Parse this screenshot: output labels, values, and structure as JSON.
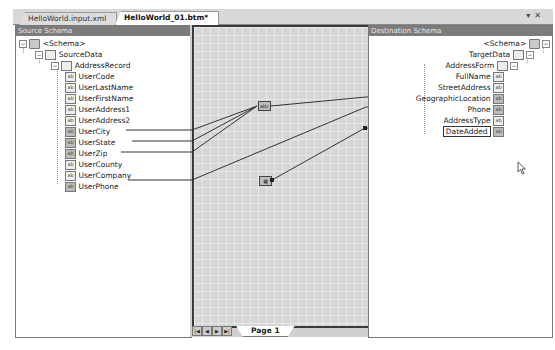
{
  "tabs": [
    {
      "label": "HelloWorld.input.xml",
      "active": false
    },
    {
      "label": "HelloWorld_01.btm*",
      "active": true
    }
  ],
  "window_buttons": {
    "dropdown": "▾",
    "close": "✕"
  },
  "source_schema": {
    "header": "Source Schema",
    "root": "<Schema>",
    "record": "SourceData",
    "subrecord": "AddressRecord",
    "fields": [
      {
        "label": "UserCode",
        "linked": false
      },
      {
        "label": "UserLastName",
        "linked": false
      },
      {
        "label": "UserFirstName",
        "linked": false
      },
      {
        "label": "UserAddress1",
        "linked": false
      },
      {
        "label": "UserAddress2",
        "linked": false
      },
      {
        "label": "UserCity",
        "linked": true
      },
      {
        "label": "UserState",
        "linked": true
      },
      {
        "label": "UserZip",
        "linked": true
      },
      {
        "label": "UserCounty",
        "linked": false
      },
      {
        "label": "UserCompany",
        "linked": false
      },
      {
        "label": "UserPhone",
        "linked": true
      }
    ]
  },
  "destination_schema": {
    "header": "Destination Schema",
    "root": "<Schema>",
    "record": "TargetData",
    "subrecord": "AddressForm",
    "fields": [
      {
        "label": "FullName",
        "linked": false
      },
      {
        "label": "StreetAddress",
        "linked": false
      },
      {
        "label": "GeographicLocation",
        "linked": true
      },
      {
        "label": "Phone",
        "linked": true
      },
      {
        "label": "AddressType",
        "linked": false
      },
      {
        "label": "DateAdded",
        "linked": true,
        "selected": true
      }
    ]
  },
  "grid": {
    "functoids": [
      {
        "name": "string-concatenate-functoid",
        "glyph": "abc"
      },
      {
        "name": "date-functoid",
        "glyph": "▦"
      }
    ],
    "page_nav": {
      "first": "|◀",
      "prev": "◀",
      "next": "▶",
      "last": "▶|"
    },
    "page_tab": "Page 1"
  }
}
